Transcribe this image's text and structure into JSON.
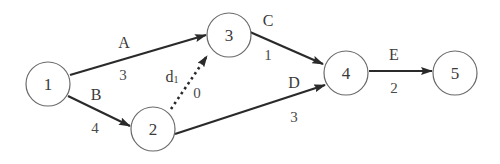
{
  "diagram": {
    "type": "activity-on-arrow network",
    "nodes": [
      {
        "id": "1",
        "label": "1",
        "x": 48,
        "y": 84
      },
      {
        "id": "2",
        "label": "2",
        "x": 153,
        "y": 129
      },
      {
        "id": "3",
        "label": "3",
        "x": 229,
        "y": 35
      },
      {
        "id": "4",
        "label": "4",
        "x": 346,
        "y": 73
      },
      {
        "id": "5",
        "label": "5",
        "x": 455,
        "y": 73
      }
    ],
    "edges": [
      {
        "from": "1",
        "to": "3",
        "activity": "A",
        "duration": "3",
        "dummy": false
      },
      {
        "from": "1",
        "to": "2",
        "activity": "B",
        "duration": "4",
        "dummy": false
      },
      {
        "from": "2",
        "to": "3",
        "activity": "d",
        "activity_sub": "1",
        "duration": "0",
        "dummy": true
      },
      {
        "from": "3",
        "to": "4",
        "activity": "C",
        "duration": "1",
        "dummy": false
      },
      {
        "from": "2",
        "to": "4",
        "activity": "D",
        "duration": "3",
        "dummy": false
      },
      {
        "from": "4",
        "to": "5",
        "activity": "E",
        "duration": "2",
        "dummy": false
      }
    ]
  }
}
